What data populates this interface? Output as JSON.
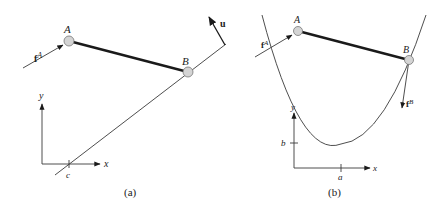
{
  "figure": {
    "panels": [
      {
        "id": "a",
        "caption": "(a)",
        "points": {
          "A": "A",
          "B": "B"
        },
        "force_label": "f",
        "force_superscript": "A",
        "normal_label": "u",
        "axes": {
          "x": "x",
          "y": "y",
          "x_tick": "c"
        },
        "constraint": "straight line through B, crossing x-axis at c"
      },
      {
        "id": "b",
        "caption": "(b)",
        "points": {
          "A": "A",
          "B": "B"
        },
        "force_A_label": "f",
        "force_A_superscript": "A",
        "force_B_label": "f",
        "force_B_superscript": "B",
        "axes": {
          "x": "x",
          "y": "y",
          "x_tick": "a",
          "y_tick": "b"
        },
        "constraint": "parabola with vertex at (a, b) through B"
      }
    ],
    "colors": {
      "line": "#3a3a3a",
      "bar": "#1a1a1a",
      "node_fill": "#d4d4d4",
      "node_stroke": "#777777",
      "text": "#222222"
    }
  }
}
